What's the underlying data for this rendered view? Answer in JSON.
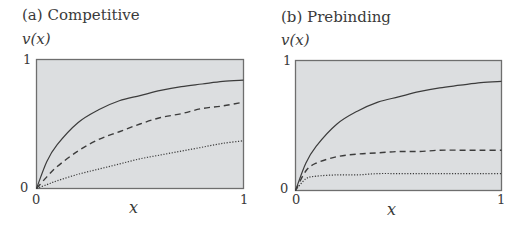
{
  "panels": [
    {
      "title": "(a)  Competitive",
      "ylabel": "v(x)",
      "xlabel": "x",
      "y_ticks": [
        "0",
        "1"
      ],
      "x_ticks": [
        "0",
        "1"
      ]
    },
    {
      "title": "(b)  Prebinding",
      "ylabel": "v(x)",
      "xlabel": "x",
      "y_ticks": [
        "0",
        "1"
      ],
      "x_ticks": [
        "0",
        "1"
      ]
    }
  ],
  "colors": {
    "plot_background": "#dcdee0",
    "frame": "#6e6e6e",
    "curve": "#3c3c3c"
  },
  "chart_data": [
    {
      "type": "line",
      "title": "(a) Competitive",
      "xlabel": "x",
      "ylabel": "v(x)",
      "xlim": [
        0,
        1
      ],
      "ylim": [
        0,
        1
      ],
      "grid": false,
      "legend": null,
      "x": [
        0,
        0.05,
        0.1,
        0.2,
        0.3,
        0.4,
        0.5,
        0.6,
        0.7,
        0.8,
        0.9,
        1.0
      ],
      "series": [
        {
          "name": "solid",
          "style": "solid",
          "values": [
            0,
            0.21,
            0.34,
            0.51,
            0.61,
            0.68,
            0.72,
            0.76,
            0.79,
            0.81,
            0.83,
            0.84
          ]
        },
        {
          "name": "dashed",
          "style": "dashed",
          "values": [
            0,
            0.09,
            0.17,
            0.29,
            0.38,
            0.44,
            0.5,
            0.55,
            0.58,
            0.62,
            0.64,
            0.67
          ]
        },
        {
          "name": "dotted",
          "style": "dotted",
          "values": [
            0,
            0.03,
            0.06,
            0.11,
            0.15,
            0.19,
            0.23,
            0.26,
            0.29,
            0.32,
            0.35,
            0.37
          ]
        }
      ]
    },
    {
      "type": "line",
      "title": "(b) Prebinding",
      "xlabel": "x",
      "ylabel": "v(x)",
      "xlim": [
        0,
        1
      ],
      "ylim": [
        0,
        1
      ],
      "grid": false,
      "legend": null,
      "x": [
        0,
        0.05,
        0.1,
        0.2,
        0.3,
        0.4,
        0.5,
        0.6,
        0.7,
        0.8,
        0.9,
        1.0
      ],
      "series": [
        {
          "name": "solid",
          "style": "solid",
          "values": [
            0,
            0.21,
            0.34,
            0.51,
            0.61,
            0.68,
            0.72,
            0.76,
            0.79,
            0.81,
            0.83,
            0.84
          ]
        },
        {
          "name": "dashed",
          "style": "dashed",
          "values": [
            0,
            0.15,
            0.21,
            0.26,
            0.28,
            0.29,
            0.3,
            0.3,
            0.31,
            0.31,
            0.31,
            0.31
          ]
        },
        {
          "name": "dotted",
          "style": "dotted",
          "values": [
            0,
            0.09,
            0.11,
            0.12,
            0.12,
            0.13,
            0.13,
            0.13,
            0.13,
            0.13,
            0.13,
            0.13
          ]
        }
      ]
    }
  ]
}
